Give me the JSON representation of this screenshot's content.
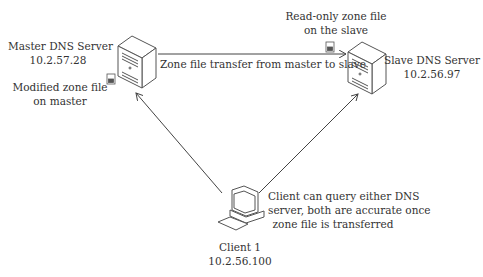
{
  "master": {
    "name": "Master DNS Server",
    "ip": "10.2.57.28",
    "file_note_line1": "Modified zone file",
    "file_note_line2": "on master"
  },
  "slave": {
    "name": "Slave DNS Server",
    "ip": "10.2.56.97",
    "file_note_line1": "Read-only zone file",
    "file_note_line2": "on the slave"
  },
  "client": {
    "name": "Client 1",
    "ip": "10.2.56.100",
    "note_line1": "Client can query either DNS",
    "note_line2": "server, both are accurate once",
    "note_line3": "zone file is transferred"
  },
  "transfer_label": "Zone file transfer from master to slave",
  "icons": {
    "master": "server-tower-icon",
    "slave": "server-tower-icon",
    "client": "desktop-computer-icon",
    "file": "zone-file-icon"
  },
  "colors": {
    "line": "#444444",
    "text": "#333333"
  }
}
